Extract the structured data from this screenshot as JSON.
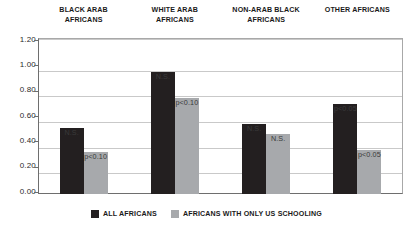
{
  "chart_data": {
    "type": "bar",
    "title": "",
    "xlabel": "",
    "ylabel": "",
    "ylim": [
      0.0,
      1.2
    ],
    "ytick_labels": [
      "1.20",
      "1.00",
      "0.80",
      "0.60",
      "0.40",
      "0.20",
      "0.00"
    ],
    "ytick_values": [
      1.2,
      1.0,
      0.8,
      0.6,
      0.4,
      0.2,
      0.0
    ],
    "grid": true,
    "legend_position": "bottom",
    "categories": [
      "BLACK ARAB AFRICANS",
      "WHITE ARAB AFRICANS",
      "NON-ARAB BLACK AFRICANS",
      "OTHER AFRICANS"
    ],
    "category_lines": [
      [
        "BLACK ARAB",
        "AFRICANS"
      ],
      [
        "WHITE ARAB",
        "AFRICANS"
      ],
      [
        "NON-ARAB BLACK",
        "AFRICANS"
      ],
      [
        "OTHER AFRICANS"
      ]
    ],
    "series": [
      {
        "name": "ALL AFRICANS",
        "color": "#231f20",
        "values": [
          0.54,
          0.98,
          0.57,
          0.73
        ],
        "annotations": [
          "N.S.",
          "N.S.",
          "N.S.",
          "p<0.05"
        ]
      },
      {
        "name": "AFRICANS WITH ONLY US SCHOOLING",
        "color": "#a7a9ac",
        "values": [
          0.35,
          0.77,
          0.49,
          0.36
        ],
        "annotations": [
          "p<0.10",
          "p<0.10",
          "N.S.",
          "p<0.05"
        ]
      }
    ]
  },
  "legend": {
    "items": [
      {
        "label": "ALL AFRICANS",
        "color": "#231f20"
      },
      {
        "label": "AFRICANS WITH ONLY US SCHOOLING",
        "color": "#a7a9ac"
      }
    ]
  },
  "colors": {
    "series_dark": "#231f20",
    "series_gray": "#a7a9ac",
    "gridline": "#c9c9c9",
    "axis": "#6e6e6e",
    "text": "#1a1a1a",
    "background": "#ffffff"
  }
}
